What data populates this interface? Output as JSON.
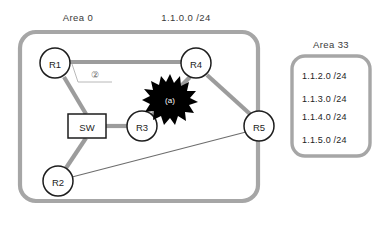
{
  "diagram": {
    "title_labels": {
      "area0_caption": "Area 0",
      "backbone_subnet": "1.1.0.0 /24",
      "area33_caption": "Area 33"
    },
    "colors": {
      "area_border": "#a6a6a6",
      "thick_link": "#9c9c9c",
      "thin_link": "#6d6d6d",
      "node_stroke": "#1d1d1d",
      "node_fill": "#ffffff",
      "burst_fill": "#000000",
      "burst_text": "#ffffff",
      "text": "#1d1d1d",
      "background": "#ffffff"
    },
    "nodes": [
      {
        "id": "R1",
        "label": "R1",
        "shape": "circle",
        "cx": 55,
        "cy": 63,
        "r": 15
      },
      {
        "id": "R4",
        "label": "R4",
        "shape": "circle",
        "cx": 196,
        "cy": 63,
        "r": 15
      },
      {
        "id": "R3",
        "label": "R3",
        "shape": "circle",
        "cx": 142,
        "cy": 126,
        "r": 15
      },
      {
        "id": "R5",
        "label": "R5",
        "shape": "circle",
        "cx": 259,
        "cy": 126,
        "r": 15
      },
      {
        "id": "R2",
        "label": "R2",
        "shape": "circle",
        "cx": 58,
        "cy": 181,
        "r": 15
      },
      {
        "id": "SW",
        "label": "SW",
        "shape": "rect",
        "x": 68,
        "y": 114,
        "w": 38,
        "h": 24
      }
    ],
    "links": [
      {
        "from": "R1",
        "to": "R4",
        "style": "thick"
      },
      {
        "from": "R1",
        "to": "SW",
        "style": "thick"
      },
      {
        "from": "SW",
        "to": "R3",
        "style": "thick"
      },
      {
        "from": "SW",
        "to": "R2",
        "style": "thick"
      },
      {
        "from": "R3",
        "to": "R4",
        "style": "thick"
      },
      {
        "from": "R4",
        "to": "R5",
        "style": "thick"
      },
      {
        "from": "R2",
        "to": "R5",
        "style": "thin"
      }
    ],
    "annotations": {
      "callout_number": "②",
      "fault_marker": "(a)"
    },
    "area0": {
      "caption": "Area 0",
      "x": 20,
      "y": 32,
      "w": 238,
      "h": 169,
      "radius": 16
    },
    "area33": {
      "caption": "Area 33",
      "x": 292,
      "y": 56,
      "w": 78,
      "h": 100,
      "radius": 13,
      "subnets": [
        {
          "text": "1.1.2.0 /24",
          "gap_after": true
        },
        {
          "text": "1.1.3.0 /24",
          "gap_after": false
        },
        {
          "text": "1.1.4.0 /24",
          "gap_after": true
        },
        {
          "text": "1.1.5.0 /24",
          "gap_after": false
        }
      ]
    }
  }
}
